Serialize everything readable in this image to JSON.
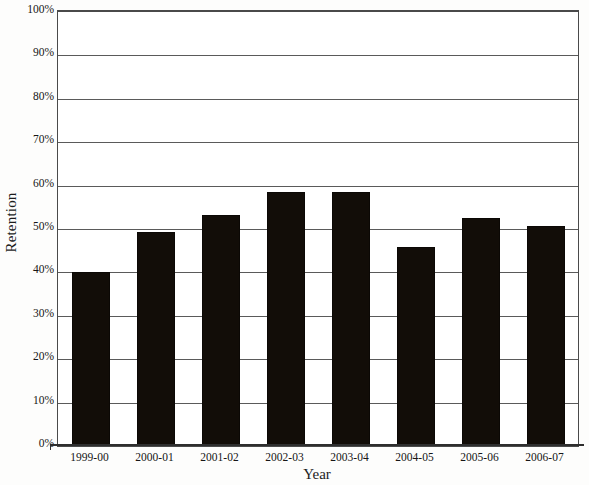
{
  "chart_data": {
    "type": "bar",
    "title": "",
    "xlabel": "Year",
    "ylabel": "Retention",
    "categories": [
      "1999-00",
      "2000-01",
      "2001-02",
      "2002-03",
      "2003-04",
      "2004-05",
      "2005-06",
      "2006-07"
    ],
    "values": [
      40.0,
      49.2,
      53.2,
      58.6,
      58.6,
      45.8,
      52.5,
      50.7
    ],
    "value_labels": [
      "40%",
      "49%",
      "53%",
      "59%",
      "59%",
      "46%",
      "52%",
      "51%"
    ],
    "ylim": [
      0,
      100
    ],
    "ytick_labels": [
      "0%",
      "10%",
      "20%",
      "30%",
      "40%",
      "50%",
      "60%",
      "70%",
      "80%",
      "90%",
      "100%"
    ],
    "ytick_values": [
      0,
      10,
      20,
      30,
      40,
      50,
      60,
      70,
      80,
      90,
      100
    ],
    "grid": true,
    "grid_axis": "y",
    "legend": false,
    "legend_position": "none",
    "bar_color": "#120d08",
    "plot_background": "#ffffff",
    "axis_color": "#2e2e2e",
    "grid_color": "#5a5a5a"
  }
}
